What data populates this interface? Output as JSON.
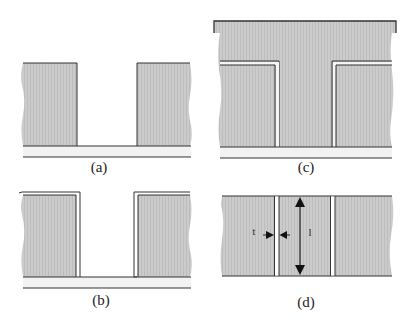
{
  "figure": {
    "colors": {
      "fill": "#c9c9c9",
      "stroke": "#333333",
      "substrate": "#f0f0f0",
      "background": "#ffffff"
    },
    "panels": [
      {
        "id": "a",
        "label": "(a)",
        "description": "trench etched between two blocks on substrate"
      },
      {
        "id": "b",
        "label": "(b)",
        "description": "thin conformal film deposited on block surfaces"
      },
      {
        "id": "c",
        "label": "(c)",
        "description": "trench filled with material, overlayer on top"
      },
      {
        "id": "d",
        "label": "(d)",
        "description": "planarized structure showing gap width and height"
      }
    ],
    "annotations": {
      "gap_width_label": "t",
      "height_label": "l"
    }
  }
}
